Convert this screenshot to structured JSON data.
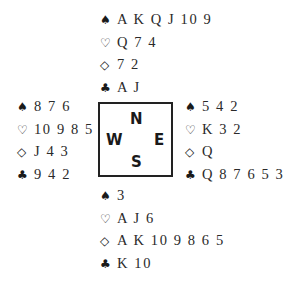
{
  "suit_symbols": {
    "spades": "♠",
    "hearts": "♡",
    "diamonds": "◇",
    "clubs": "♣"
  },
  "compass": {
    "north": "N",
    "west": "W",
    "east": "E",
    "south": "S"
  },
  "hands": {
    "north": {
      "spades": "A K Q J 10 9",
      "hearts": "Q 7 4",
      "diamonds": "7 2",
      "clubs": "A J"
    },
    "west": {
      "spades": "8 7 6",
      "hearts": "10 9 8 5",
      "diamonds": "J 4 3",
      "clubs": "9 4 2"
    },
    "east": {
      "spades": "5 4 2",
      "hearts": "K 3 2",
      "diamonds": "Q",
      "clubs": "Q 8 7 6 5 3"
    },
    "south": {
      "spades": "3",
      "hearts": "A J 6",
      "diamonds": "A K 10 9 8 6 5",
      "clubs": "K 10"
    }
  }
}
